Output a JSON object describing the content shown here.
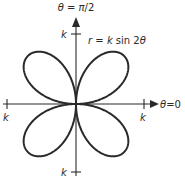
{
  "diagram": {
    "equation_label": "r = k sin 2θ",
    "axes": {
      "polar_axis_label": "θ = 0",
      "vertical_axis_label": "θ = π/2"
    },
    "tick_labels": {
      "top": "k",
      "bottom": "k",
      "left": "k",
      "right": "k"
    },
    "curve": {
      "type": "rose",
      "equation": "r = k sin 2θ",
      "petals": 4
    },
    "colors": {
      "stroke": "#2a2a2a",
      "background": "#ffffff"
    }
  }
}
